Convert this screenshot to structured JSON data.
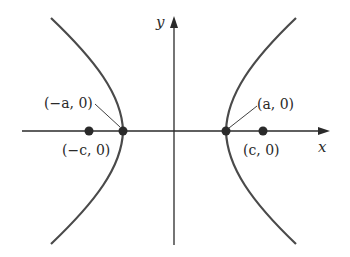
{
  "diagram": {
    "axes": {
      "x_label": "x",
      "y_label": "y"
    },
    "points": [
      {
        "id": "left-vertex",
        "label": "(−a, 0)"
      },
      {
        "id": "left-focus",
        "label": "(−c, 0)"
      },
      {
        "id": "right-vertex",
        "label": "(a, 0)"
      },
      {
        "id": "right-focus",
        "label": "(c, 0)"
      }
    ],
    "colors": {
      "curve": "#4a4a4a",
      "axis": "#2a2a2a",
      "point": "#2a2a2a"
    }
  }
}
